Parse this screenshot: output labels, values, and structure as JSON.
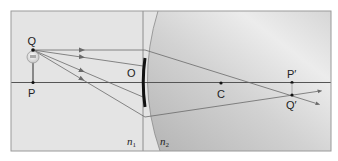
{
  "diagram": {
    "colors": {
      "background_n1": "#e4e4e4",
      "background_n2_dark": "#b8b8b8",
      "background_n2_light": "#f0f0f0",
      "frame": "#9a9a9a",
      "axis": "#555555",
      "ray": "#6a6a6a",
      "aperture": "#111111",
      "point": "#111111"
    },
    "labels": {
      "object_top": "Q",
      "object_base": "P",
      "vertex": "O",
      "center": "C",
      "image_base": "P′",
      "image_top": "Q′",
      "medium_1": "n",
      "medium_1_sub": "1",
      "medium_2": "n",
      "medium_2_sub": "2"
    },
    "points": {
      "Q": [
        33,
        50
      ],
      "P": [
        33,
        82
      ],
      "O": [
        143,
        82
      ],
      "C": [
        221,
        83
      ],
      "P_prime": [
        292,
        83
      ],
      "Q_prime": [
        292,
        95
      ]
    },
    "object_icon": "light-bulb-icon",
    "rays": [
      {
        "from": [
          33,
          50
        ],
        "to": [
          145,
          50
        ],
        "refracted_to": [
          318,
          104
        ]
      },
      {
        "from": [
          33,
          50
        ],
        "to": [
          143,
          66
        ]
      },
      {
        "from": [
          33,
          50
        ],
        "to": [
          143,
          97
        ]
      },
      {
        "from": [
          33,
          50
        ],
        "to": [
          145,
          117
        ],
        "refracted_to": [
          320,
          91
        ]
      }
    ]
  }
}
